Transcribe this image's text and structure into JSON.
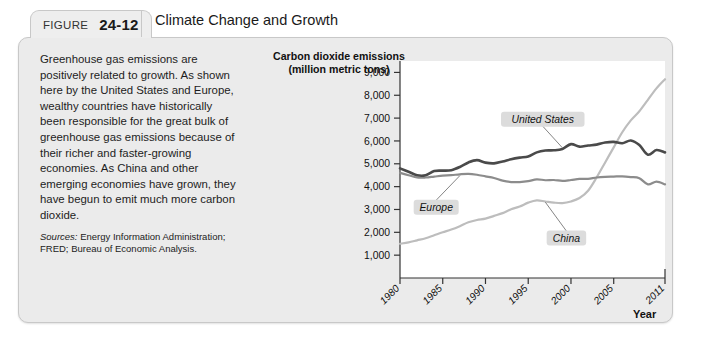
{
  "figure": {
    "label_word": "FIGURE",
    "number": "24-12",
    "title": "Climate Change and Growth"
  },
  "body": {
    "paragraph": "Greenhouse gas emissions are positively related to growth. As shown here by the United States and Europe, wealthy countries have historically been responsible for the great bulk of greenhouse gas emissions because of their richer and faster-growing economies. As China and other emerging economies have grown, they have begun to emit much more carbon dioxide.",
    "sources_label": "Sources:",
    "sources_text": "Energy Information Administration; FRED; Bureau of Economic Analysis."
  },
  "colors": {
    "panel_background": "#ebebeb",
    "tab_background": "#eeeeee",
    "border": "#c8c8c8",
    "plot_background": "#ffffff",
    "united_states": "#4a4a4a",
    "europe": "#8c8c8c",
    "china": "#bdbdbd",
    "callout_background": "#dcdcdc"
  },
  "chart_data": {
    "type": "line",
    "title": "Carbon dioxide emissions (million metric tons)",
    "title_line1": "Carbon dioxide emissions",
    "title_line2": "(million metric tons)",
    "xlabel": "Year",
    "ylabel": "Carbon dioxide emissions (million metric tons)",
    "xlim": [
      1980,
      2011
    ],
    "ylim": [
      0,
      9500
    ],
    "grid": false,
    "legend_position": "inline-callouts",
    "ytick_labels": [
      "1,000",
      "2,000",
      "3,000",
      "4,000",
      "5,000",
      "6,000",
      "7,000",
      "8,000",
      "9,000"
    ],
    "ytick_values": [
      1000,
      2000,
      3000,
      4000,
      5000,
      6000,
      7000,
      8000,
      9000
    ],
    "xtick_labels": [
      "1980",
      "1985",
      "1990",
      "1995",
      "2000",
      "2005",
      "2011"
    ],
    "xtick_values": [
      1980,
      1985,
      1990,
      1995,
      2000,
      2005,
      2011
    ],
    "x": [
      1980,
      1981,
      1982,
      1983,
      1984,
      1985,
      1986,
      1987,
      1988,
      1989,
      1990,
      1991,
      1992,
      1993,
      1994,
      1995,
      1996,
      1997,
      1998,
      1999,
      2000,
      2001,
      2002,
      2003,
      2004,
      2005,
      2006,
      2007,
      2008,
      2009,
      2010,
      2011
    ],
    "series": [
      {
        "name": "United States",
        "color": "#4a4a4a",
        "values": [
          4800,
          4650,
          4500,
          4500,
          4680,
          4700,
          4720,
          4860,
          5060,
          5160,
          5050,
          5020,
          5100,
          5200,
          5270,
          5320,
          5500,
          5580,
          5590,
          5650,
          5860,
          5750,
          5800,
          5840,
          5930,
          5960,
          5900,
          6020,
          5820,
          5400,
          5600,
          5500
        ]
      },
      {
        "name": "Europe",
        "color": "#8c8c8c",
        "values": [
          4600,
          4500,
          4400,
          4400,
          4440,
          4480,
          4500,
          4540,
          4560,
          4520,
          4450,
          4380,
          4260,
          4200,
          4200,
          4240,
          4320,
          4280,
          4290,
          4250,
          4290,
          4340,
          4340,
          4400,
          4430,
          4440,
          4450,
          4420,
          4370,
          4100,
          4220,
          4100
        ]
      },
      {
        "name": "China",
        "color": "#bdbdbd",
        "values": [
          1500,
          1560,
          1650,
          1740,
          1870,
          2000,
          2120,
          2270,
          2440,
          2540,
          2600,
          2720,
          2840,
          3010,
          3130,
          3300,
          3400,
          3350,
          3300,
          3280,
          3350,
          3500,
          3820,
          4400,
          5060,
          5720,
          6380,
          6900,
          7300,
          7800,
          8300,
          8700
        ]
      }
    ],
    "callouts": [
      {
        "label": "United States",
        "series": "United States"
      },
      {
        "label": "Europe",
        "series": "Europe"
      },
      {
        "label": "China",
        "series": "China"
      }
    ]
  }
}
